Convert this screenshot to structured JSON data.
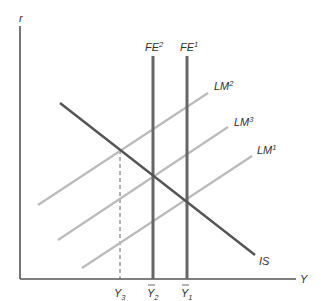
{
  "diagram": {
    "type": "IS-LM-FE",
    "axes": {
      "y_label": "r",
      "x_label": "Y"
    },
    "curves": [
      {
        "id": "IS",
        "label": "IS",
        "color": "#555555"
      },
      {
        "id": "FE2",
        "label": "FE",
        "sup": "2",
        "color": "#666666"
      },
      {
        "id": "FE1",
        "label": "FE",
        "sup": "1",
        "color": "#666666"
      },
      {
        "id": "LM2",
        "label": "LM",
        "sup": "2",
        "color": "#bbbbbb"
      },
      {
        "id": "LM3",
        "label": "LM",
        "sup": "3",
        "color": "#bbbbbb"
      },
      {
        "id": "LM1",
        "label": "LM",
        "sup": "1",
        "color": "#bbbbbb"
      }
    ],
    "x_ticks": [
      {
        "label": "Y",
        "sub": "3",
        "bar": false
      },
      {
        "label": "Y",
        "sub": "2",
        "bar": true
      },
      {
        "label": "Y",
        "sub": "1",
        "bar": true
      }
    ]
  }
}
